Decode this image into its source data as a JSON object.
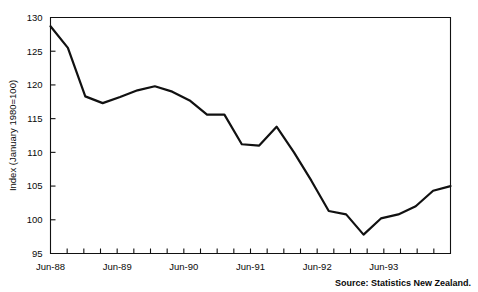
{
  "chart_data": {
    "type": "line",
    "title": "",
    "xlabel": "",
    "ylabel": "Index (January 1980=100)",
    "ylim": [
      95,
      130
    ],
    "ytick_values": [
      95,
      100,
      105,
      110,
      115,
      120,
      125,
      130
    ],
    "ytick_labels": [
      "95",
      "100",
      "105",
      "110",
      "115",
      "120",
      "125",
      "130"
    ],
    "xlim": [
      "Jun-88",
      "Mar-94"
    ],
    "xtick_labels": [
      "Jun-88",
      "Jun-89",
      "Jun-90",
      "Jun-91",
      "Jun-92",
      "Jun-93"
    ],
    "xtick_label_positions": [
      0,
      4,
      8,
      12,
      16,
      20
    ],
    "minor_tick_count": 24,
    "grid": false,
    "legend": null,
    "legend_position": "none",
    "source_note": "Source: Statistics New Zealand.",
    "x": [
      "Jun-88",
      "Sep-88",
      "Dec-88",
      "Mar-89",
      "Jun-89",
      "Sep-89",
      "Dec-89",
      "Mar-90",
      "Jun-90",
      "Sep-90",
      "Dec-90",
      "Mar-91",
      "Jun-91",
      "Sep-91",
      "Dec-91",
      "Mar-92",
      "Jun-92",
      "Sep-92",
      "Dec-92",
      "Mar-93",
      "Jun-93",
      "Sep-93",
      "Dec-93",
      "Mar-94"
    ],
    "values": [
      128.7,
      125.5,
      118.3,
      117.3,
      118.2,
      119.2,
      119.8,
      119.0,
      117.7,
      115.6,
      115.6,
      111.2,
      111.0,
      113.8,
      110.0,
      105.8,
      101.3,
      100.8,
      97.8,
      100.2,
      100.8,
      102.0,
      104.3,
      105.0
    ],
    "series": [
      {
        "name": "Index (January 1980=100)",
        "color": "#111111",
        "values": [
          128.7,
          125.5,
          118.3,
          117.3,
          118.2,
          119.2,
          119.8,
          119.0,
          117.7,
          115.6,
          115.6,
          111.2,
          111.0,
          113.8,
          110.0,
          105.8,
          101.3,
          100.8,
          97.8,
          100.2,
          100.8,
          102.0,
          104.3,
          105.0
        ]
      }
    ]
  },
  "colors": {
    "line": "#111111",
    "axis": "#111111",
    "text": "#0a0a0a",
    "background": "#ffffff"
  }
}
